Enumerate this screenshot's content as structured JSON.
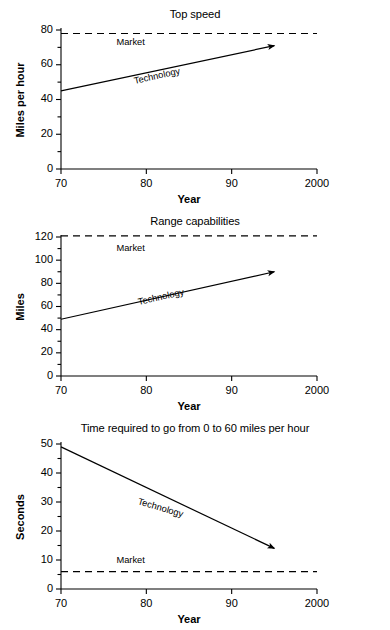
{
  "figure": {
    "background": "#ffffff",
    "ink": "#000000",
    "panel_count": 3
  },
  "chart_data": [
    {
      "type": "line",
      "title": "Top speed",
      "xlabel": "Year",
      "ylabel": "Miles per hour",
      "xlim": [
        70,
        100
      ],
      "ylim": [
        0,
        80
      ],
      "xticks": [
        70,
        80,
        90,
        100
      ],
      "xtick_labels": [
        "70",
        "80",
        "90",
        "2000"
      ],
      "yticks": [
        0,
        20,
        40,
        60,
        80
      ],
      "ytick_labels": [
        "0",
        "20",
        "40",
        "60",
        "80"
      ],
      "yminor": [
        10,
        30,
        50,
        70
      ],
      "grid": false,
      "legend": "inline-annotations",
      "series": [
        {
          "name": "Technology",
          "style": "solid-arrow",
          "x": [
            70,
            95
          ],
          "values": [
            45,
            71
          ]
        },
        {
          "name": "Market",
          "style": "dashed-horizontal",
          "x": [
            70,
            100
          ],
          "values": [
            78,
            78
          ]
        }
      ],
      "annotations": [
        {
          "text": "Market",
          "x": 76.5,
          "y": 72.5,
          "rotation": 0
        },
        {
          "text": "Technology",
          "x": 78.5,
          "y": 50,
          "rotation": -12.5
        }
      ]
    },
    {
      "type": "line",
      "title": "Range capabilities",
      "xlabel": "Year",
      "ylabel": "Miles",
      "xlim": [
        70,
        100
      ],
      "ylim": [
        0,
        120
      ],
      "xticks": [
        70,
        80,
        90,
        100
      ],
      "xtick_labels": [
        "70",
        "80",
        "90",
        "2000"
      ],
      "yticks": [
        0,
        20,
        40,
        60,
        80,
        100,
        120
      ],
      "ytick_labels": [
        "0",
        "20",
        "40",
        "60",
        "80",
        "100",
        "120"
      ],
      "yminor": [
        10,
        30,
        50,
        70,
        90,
        110
      ],
      "grid": false,
      "legend": "inline-annotations",
      "series": [
        {
          "name": "Technology",
          "style": "solid-arrow",
          "x": [
            70,
            95
          ],
          "values": [
            49,
            90
          ]
        },
        {
          "name": "Market",
          "style": "dashed-horizontal",
          "x": [
            70,
            100
          ],
          "values": [
            121,
            121
          ]
        }
      ],
      "annotations": [
        {
          "text": "Market",
          "x": 76.5,
          "y": 110,
          "rotation": 0
        },
        {
          "text": "Technology",
          "x": 79,
          "y": 63,
          "rotation": -12.5
        }
      ]
    },
    {
      "type": "line",
      "title": "Time required to go from 0 to 60 miles per hour",
      "xlabel": "Year",
      "ylabel": "Seconds",
      "xlim": [
        70,
        100
      ],
      "ylim": [
        0,
        50
      ],
      "xticks": [
        70,
        80,
        90,
        100
      ],
      "xtick_labels": [
        "70",
        "80",
        "90",
        "2000"
      ],
      "yticks": [
        0,
        10,
        20,
        30,
        40,
        50
      ],
      "ytick_labels": [
        "0",
        "10",
        "20",
        "30",
        "40",
        "50"
      ],
      "yminor": [
        5,
        15,
        25,
        35,
        45
      ],
      "grid": false,
      "legend": "inline-annotations",
      "series": [
        {
          "name": "Technology",
          "style": "solid-arrow",
          "x": [
            70,
            95
          ],
          "values": [
            49,
            14
          ]
        },
        {
          "name": "Market",
          "style": "dashed-horizontal",
          "x": [
            70,
            100
          ],
          "values": [
            6,
            6
          ]
        }
      ],
      "annotations": [
        {
          "text": "Market",
          "x": 76.5,
          "y": 9.5,
          "rotation": 0
        },
        {
          "text": "Technology",
          "x": 79,
          "y": 30,
          "rotation": 16.5
        }
      ]
    }
  ]
}
